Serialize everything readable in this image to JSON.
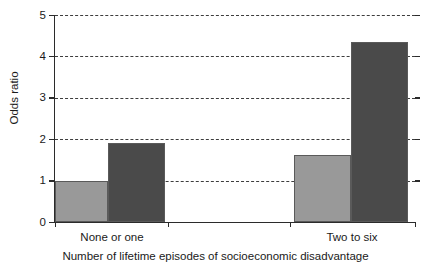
{
  "chart_data": {
    "type": "bar",
    "title": "",
    "xlabel": "Number of lifetime episodes of socioeconomic disadvantage",
    "ylabel": "Odds ratio",
    "categories": [
      "None or one",
      "Two to six"
    ],
    "series": [
      {
        "name": "light-gray-bar",
        "color": "#999999",
        "values": [
          1.0,
          1.62
        ]
      },
      {
        "name": "dark-gray-bar",
        "color": "#4a4a4a",
        "values": [
          1.92,
          4.35
        ]
      }
    ],
    "ylim": [
      0,
      5
    ],
    "yticks": [
      0,
      1,
      2,
      3,
      4,
      5
    ],
    "ytick_labels": [
      "0",
      "1",
      "2",
      "3",
      "4",
      "5"
    ],
    "grid": true,
    "grid_style": "dashed",
    "legend": "none",
    "legend_position": "none"
  },
  "axes": {
    "y_title": "Odds ratio",
    "x_title": "Number of lifetime episodes of socioeconomic disadvantage",
    "y_labels": [
      "0",
      "1",
      "2",
      "3",
      "4",
      "5"
    ],
    "x_labels": [
      "None or one",
      "Two to six"
    ]
  },
  "colors": {
    "light_bar": "#999999",
    "dark_bar": "#4a4a4a",
    "bar_outline": "#5a5a5a",
    "axis": "#2b2b2b",
    "gridline": "#3d3d3d",
    "background": "#ffffff",
    "text": "#1a1a1a"
  }
}
